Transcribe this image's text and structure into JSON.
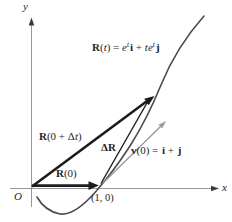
{
  "colors": {
    "background": "#ffffff",
    "axis": "#8b8b8b",
    "axis_arrow": "#3a3a3a",
    "vector": "#1c1c1c",
    "velocity_vector": "#9c9c9c",
    "curve": "#4e4a48"
  },
  "figure": {
    "axes": {
      "y_label": "y",
      "x_label": "x",
      "origin_label": "O"
    },
    "point_label": "(1, 0)",
    "curve_label": {
      "R": "R",
      "open": "(",
      "t": "t",
      "eq": ") = ",
      "e": "e",
      "exp1": "t",
      "i": "i",
      "plus": " + ",
      "te": "te",
      "exp2": "t",
      "j": "j"
    },
    "position_initial_label": {
      "R": "R",
      "rest": "(0)"
    },
    "position_delta_label": {
      "R": "R",
      "open": "(0 + Δ",
      "t": "t",
      "close": ")"
    },
    "delta_r_label": "ΔR",
    "velocity_label": {
      "v": "v",
      "mid": "(0) = ",
      "i": "i",
      "plus": " + ",
      "j": "j"
    }
  }
}
